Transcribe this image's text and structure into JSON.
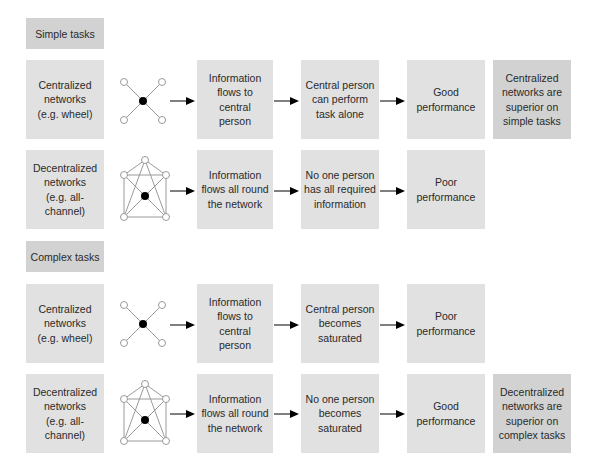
{
  "sections": [
    {
      "header": "Simple tasks",
      "rows": [
        {
          "network": "Centralized networks (e.g. wheel)",
          "network_lines": [
            "Centralized",
            "networks",
            "(e.g. wheel)"
          ],
          "graph": "wheel-network-icon",
          "step1_lines": [
            "Information",
            "flows to central",
            "person"
          ],
          "step2_lines": [
            "Central person",
            "can perform",
            "task alone"
          ],
          "outcome_lines": [
            "Good",
            "performance"
          ],
          "conclusion_lines": [
            "Centralized",
            "networks are",
            "superior on",
            "simple tasks"
          ]
        },
        {
          "network": "Decentralized networks (e.g. all-channel)",
          "network_lines": [
            "Decentralized",
            "networks",
            "(e.g. all-",
            "channel)"
          ],
          "graph": "all-channel-network-icon",
          "step1_lines": [
            "Information",
            "flows all round",
            "the network"
          ],
          "step2_lines": [
            "No one person",
            "has all required",
            "information"
          ],
          "outcome_lines": [
            "Poor",
            "performance"
          ],
          "conclusion_lines": []
        }
      ]
    },
    {
      "header": "Complex tasks",
      "rows": [
        {
          "network": "Centralized networks (e.g. wheel)",
          "network_lines": [
            "Centralized",
            "networks",
            "(e.g. wheel)"
          ],
          "graph": "wheel-network-icon",
          "step1_lines": [
            "Information",
            "flows to central",
            "person"
          ],
          "step2_lines": [
            "Central person",
            "becomes",
            "saturated"
          ],
          "outcome_lines": [
            "Poor",
            "performance"
          ],
          "conclusion_lines": []
        },
        {
          "network": "Decentralized networks (e.g. all-channel)",
          "network_lines": [
            "Decentralized",
            "networks",
            "(e.g. all-",
            "channel)"
          ],
          "graph": "all-channel-network-icon",
          "step1_lines": [
            "Information",
            "flows all round",
            "the network"
          ],
          "step2_lines": [
            "No one person",
            "becomes",
            "saturated"
          ],
          "outcome_lines": [
            "Good",
            "performance"
          ],
          "conclusion_lines": [
            "Decentralized",
            "networks are",
            "superior on",
            "complex tasks"
          ]
        }
      ]
    }
  ],
  "colors": {
    "box": "#e1e1e1",
    "box_dark": "#d2d2d2",
    "text": "#2a2a2a",
    "edge": "#9a9a9a",
    "central_node": "#000000"
  }
}
